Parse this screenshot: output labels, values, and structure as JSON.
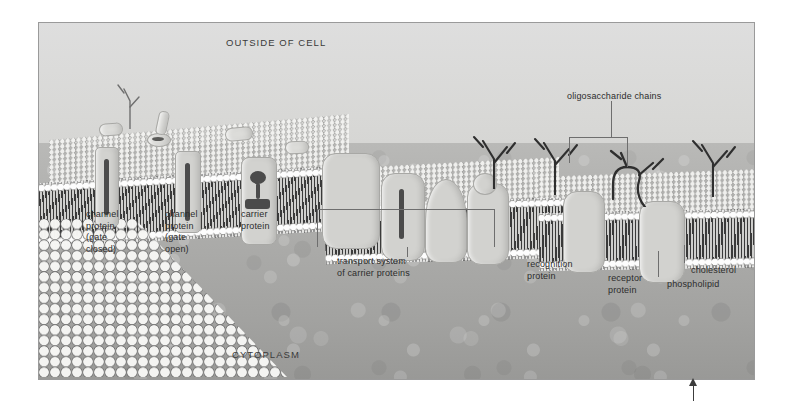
{
  "figure": {
    "frame": {
      "left": 38,
      "top": 22,
      "width": 715,
      "height": 356
    }
  },
  "regions": {
    "outside_label": "OUTSIDE OF CELL",
    "cytoplasm_label": "CYTOPLASM"
  },
  "labels": [
    {
      "id": "channel-closed",
      "text": "channel\nprotein\n(gate\nclosed)",
      "x": 85,
      "y": 208
    },
    {
      "id": "channel-open",
      "text": "channel\nprotein\n(gate\nopen)",
      "x": 164,
      "y": 208
    },
    {
      "id": "carrier",
      "text": "carrier\nprotein",
      "x": 240,
      "y": 208
    },
    {
      "id": "transport",
      "text": "transport system\nof carrier proteins",
      "x": 336,
      "y": 255
    },
    {
      "id": "recognition",
      "text": "recognition\nprotein",
      "x": 526,
      "y": 258
    },
    {
      "id": "receptor",
      "text": "receptor\nprotein",
      "x": 607,
      "y": 272
    },
    {
      "id": "cholesterol",
      "text": "cholesterol",
      "x": 690,
      "y": 264
    },
    {
      "id": "phospholipid",
      "text": "phospholipid",
      "x": 666,
      "y": 278
    },
    {
      "id": "oligosaccharide",
      "text": "oligosaccharide chains",
      "x": 566,
      "y": 90
    }
  ],
  "colors": {
    "outside_fluid": "#dedede",
    "cytoplasm": "#adadab",
    "protein": "#d2d2cf",
    "membrane_tail": "#3a3a3a",
    "label_text": "#2c2c2c",
    "leader_line": "#6e6e6e",
    "frame_border": "#9a9a9a",
    "page_background": "#ffffff",
    "arrow": "#3c3c3c"
  },
  "structures": {
    "membrane_segments": 4,
    "channel_proteins": 2,
    "carrier_proteins": 1,
    "transport_system_proteins": 4,
    "recognition_proteins": 1,
    "receptor_proteins": 1,
    "oligosaccharide_chains": 5
  },
  "annotations": {
    "bottom_arrow": {
      "present": true,
      "x": 693,
      "direction": "up"
    }
  }
}
